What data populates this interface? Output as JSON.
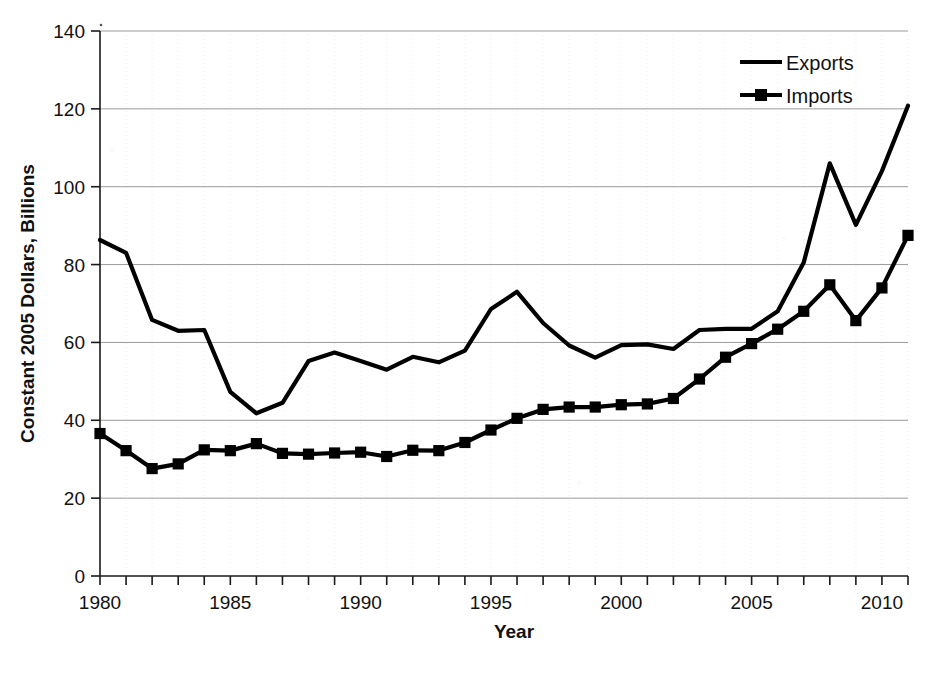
{
  "chart_data": {
    "type": "line",
    "title": "",
    "xlabel": "Year",
    "ylabel": "Constant 2005 Dollars, Billions",
    "xlim": [
      1980,
      2011
    ],
    "ylim": [
      0,
      140
    ],
    "ytick_step": 20,
    "xtick_step": 1,
    "xtick_label_step": 5,
    "grid": true,
    "legend_position": "top-right",
    "yticks": [
      "0",
      "20",
      "40",
      "60",
      "80",
      "100",
      "120",
      "140"
    ],
    "xticks_labeled": [
      "1980",
      "1985",
      "1990",
      "1995",
      "2000",
      "2005",
      "2010"
    ],
    "x": [
      1980,
      1981,
      1982,
      1983,
      1984,
      1985,
      1986,
      1987,
      1988,
      1989,
      1990,
      1991,
      1992,
      1993,
      1994,
      1995,
      1996,
      1997,
      1998,
      1999,
      2000,
      2001,
      2002,
      2003,
      2004,
      2005,
      2006,
      2007,
      2008,
      2009,
      2010,
      2011
    ],
    "series": [
      {
        "name": "Exports",
        "marker": "none",
        "color": "#000000",
        "values": [
          86.3,
          83.0,
          65.8,
          63.0,
          63.2,
          47.3,
          41.8,
          44.5,
          55.2,
          57.4,
          55.2,
          53.0,
          56.3,
          54.9,
          57.9,
          68.6,
          73.0,
          65.0,
          59.2,
          56.1,
          59.3,
          59.5,
          58.3,
          63.2,
          63.5,
          63.5,
          68.0,
          80.5,
          106.0,
          90.2,
          104.0,
          120.8
        ]
      },
      {
        "name": "Imports",
        "marker": "square",
        "color": "#000000",
        "values": [
          36.6,
          32.2,
          27.6,
          28.8,
          32.4,
          32.2,
          34.0,
          31.5,
          31.3,
          31.6,
          31.8,
          30.7,
          32.3,
          32.2,
          34.3,
          37.5,
          40.5,
          42.8,
          43.4,
          43.4,
          44.0,
          44.2,
          45.6,
          50.6,
          56.2,
          59.7,
          63.4,
          68.0,
          74.8,
          65.6,
          74.0,
          87.5
        ]
      }
    ]
  },
  "legend": {
    "items": [
      {
        "label": "Exports",
        "marker": "line"
      },
      {
        "label": "Imports",
        "marker": "line-square"
      }
    ]
  },
  "axes": {
    "x_title": "Year",
    "y_title": "Constant 2005 Dollars, Billions"
  },
  "caption": {
    "partial_text": "partial caption text cropped at bottom edge"
  }
}
